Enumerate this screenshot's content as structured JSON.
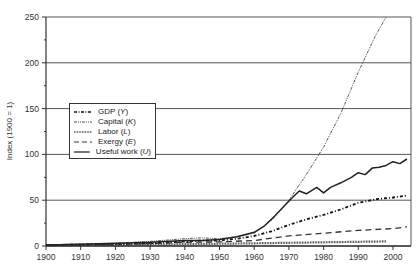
{
  "chart_data": {
    "type": "line",
    "title": "",
    "xlabel": "",
    "ylabel": "Index (1900 = 1)",
    "xlim": [
      1900,
      2005
    ],
    "ylim": [
      0,
      250
    ],
    "x_ticks": [
      1900,
      1910,
      1920,
      1930,
      1940,
      1950,
      1960,
      1970,
      1980,
      1990,
      2000
    ],
    "y_ticks": [
      0,
      50,
      100,
      150,
      200,
      250
    ],
    "grid": "horizontal at 50, 100, 150, 200, 250",
    "legend_position": "upper-left (inside plot, around y=100-150)",
    "series": [
      {
        "name": "GDP (Y)",
        "style": "dash-dot",
        "x": [
          1900,
          1910,
          1920,
          1930,
          1940,
          1945,
          1950,
          1955,
          1960,
          1965,
          1970,
          1975,
          1980,
          1985,
          1990,
          1995,
          2000,
          2004
        ],
        "values": [
          1,
          1.5,
          2,
          3,
          5,
          6,
          6,
          8,
          11,
          16,
          23,
          29,
          34,
          40,
          47,
          51,
          53,
          55
        ]
      },
      {
        "name": "Capital (K)",
        "style": "dash-dot-dot",
        "x": [
          1900,
          1910,
          1920,
          1930,
          1940,
          1945,
          1950,
          1955,
          1960,
          1965,
          1970,
          1975,
          1980,
          1985,
          1990,
          1995,
          1998
        ],
        "values": [
          1,
          2,
          3,
          5,
          8,
          9,
          8,
          10,
          14,
          28,
          50,
          78,
          108,
          145,
          190,
          230,
          250
        ]
      },
      {
        "name": "Labor (L)",
        "style": "dotted",
        "x": [
          1900,
          1920,
          1940,
          1960,
          1980,
          1998
        ],
        "values": [
          1,
          1.5,
          2,
          3,
          4,
          5
        ]
      },
      {
        "name": "Exergy (E)",
        "style": "dashed",
        "x": [
          1900,
          1910,
          1920,
          1930,
          1940,
          1950,
          1960,
          1970,
          1980,
          1990,
          2000,
          2004
        ],
        "values": [
          1,
          1.5,
          2,
          2.5,
          4,
          4.5,
          6,
          11,
          14,
          17,
          19,
          21
        ]
      },
      {
        "name": "Useful work (U)",
        "style": "solid",
        "x": [
          1900,
          1910,
          1920,
          1930,
          1940,
          1945,
          1950,
          1955,
          1960,
          1963,
          1966,
          1969,
          1971,
          1973,
          1975,
          1978,
          1980,
          1982,
          1985,
          1988,
          1990,
          1992,
          1994,
          1996,
          1998,
          2000,
          2002,
          2004
        ],
        "values": [
          1,
          2,
          3,
          4,
          6,
          6,
          7,
          10,
          15,
          22,
          33,
          45,
          53,
          60,
          57,
          64,
          58,
          64,
          69,
          75,
          80,
          78,
          85,
          86,
          88,
          92,
          90,
          95
        ]
      }
    ]
  },
  "legend": {
    "items": [
      {
        "name": "GDP",
        "sym": "Y"
      },
      {
        "name": "Capital",
        "sym": "K"
      },
      {
        "name": "Labor",
        "sym": "L"
      },
      {
        "name": "Exergy",
        "sym": "E"
      },
      {
        "name": "Useful work",
        "sym": "U"
      }
    ]
  },
  "axes": {
    "ylabel": "Index (1900 = 1)"
  }
}
